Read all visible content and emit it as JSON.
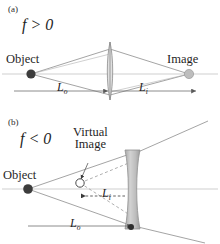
{
  "figure": {
    "colors": {
      "axis": "#c9c9c9",
      "ray": "#8a8a8a",
      "dashed_ray": "#9a9a9a",
      "object_dot": "#3a3a3a",
      "image_dot": "#b4b4b4",
      "lens_fill": "#bcbcbc",
      "lens_stroke": "#8f8f8f",
      "dimension_line": "#6f6f6f",
      "text": "#1f1f1f"
    },
    "panels": [
      {
        "tag": "(a)",
        "focal_condition": "f > 0",
        "focal_symbol": "f",
        "focal_operator": ">",
        "focal_value": "0",
        "lens_type": "converging-biconvex",
        "object_label": "Object",
        "image_label": "Image",
        "object_distance_label": "L",
        "object_distance_sub": "o",
        "image_distance_label": "L",
        "image_distance_sub": "i"
      },
      {
        "tag": "(b)",
        "focal_condition": "f < 0",
        "focal_symbol": "f",
        "focal_operator": "<",
        "focal_value": "0",
        "lens_type": "diverging-biconcave",
        "object_label": "Object",
        "virtual_image_label_line1": "Virtual",
        "virtual_image_label_line2": "Image",
        "object_distance_label": "L",
        "object_distance_sub": "o",
        "image_distance_label": "L",
        "image_distance_sub": "i"
      }
    ]
  }
}
